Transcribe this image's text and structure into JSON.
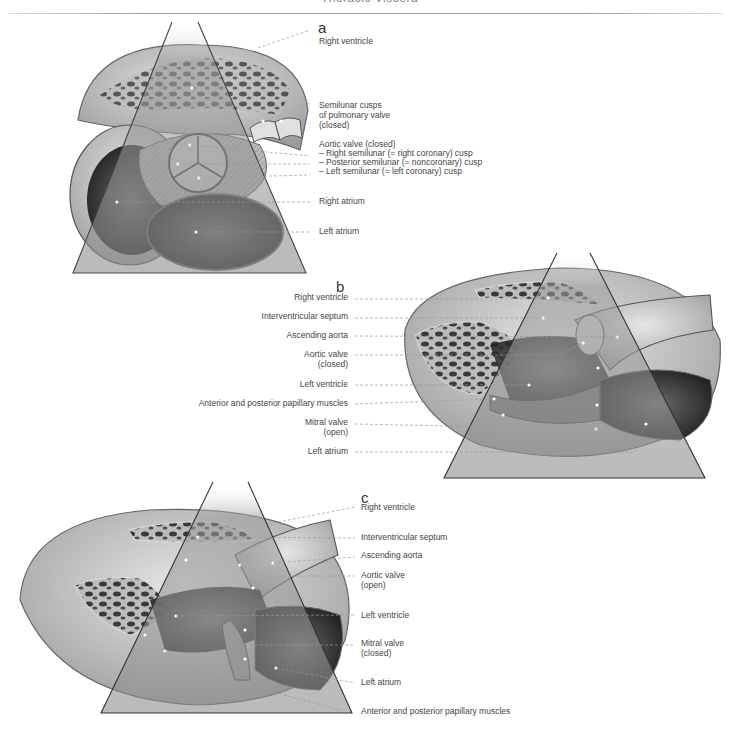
{
  "header": {
    "title": "Thoracic Viscera"
  },
  "figure": {
    "panels": [
      {
        "letter": "a",
        "labels": [
          "Right ventricle",
          "Semilunar cusps",
          "of pulmonary valve",
          "(closed)",
          "Aortic valve (closed)",
          "– Right semilunar (= right coronary) cusp",
          "– Posterior semilunar (= noncoronary) cusp",
          "– Left semilunar (= left coronary) cusp",
          "Right atrium",
          "Left atrium"
        ]
      },
      {
        "letter": "b",
        "labels": [
          "Right ventricle",
          "Interventricular septum",
          "Ascending aorta",
          "Aortic valve",
          "(closed)",
          "Left ventricle",
          "Anterior and posterior papillary muscles",
          "Mitral valve",
          "(open)",
          "Left atrium"
        ]
      },
      {
        "letter": "c",
        "labels": [
          "Right ventricle",
          "Interventricular septum",
          "Ascending aorta",
          "Aortic valve",
          "(open)",
          "Left ventricle",
          "Mitral valve",
          "(closed)",
          "Left atrium",
          "Anterior and posterior papillary muscles"
        ]
      }
    ],
    "colors": {
      "tissue_light": "#bdbdbd",
      "tissue_mid": "#8a8a8a",
      "tissue_dark": "#2e2e2e",
      "wedge_fill": "#9e9e9e",
      "leader_line": "#9a9a9a"
    }
  }
}
